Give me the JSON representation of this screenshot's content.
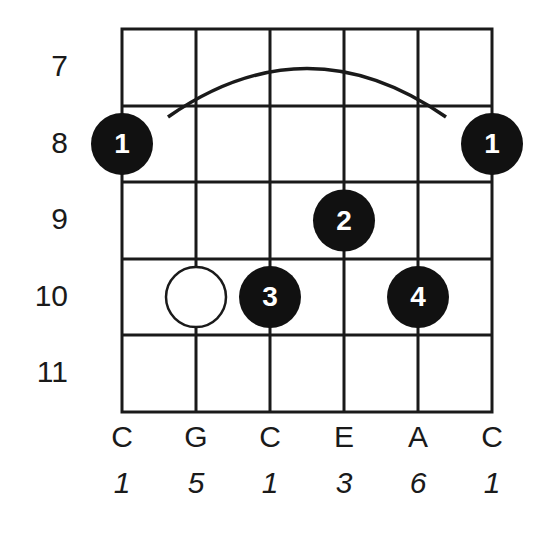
{
  "chord_diagram": {
    "frets": [
      "7",
      "8",
      "9",
      "10",
      "11"
    ],
    "strings": {
      "notes": [
        "C",
        "G",
        "C",
        "E",
        "A",
        "C"
      ],
      "intervals": [
        "1",
        "5",
        "1",
        "3",
        "6",
        "1"
      ]
    },
    "barre": {
      "fret": "8",
      "from_string": 0,
      "to_string": 5,
      "finger": "1"
    },
    "fingerings": [
      {
        "string": 0,
        "fret_index": 1,
        "finger": "1",
        "type": "filled"
      },
      {
        "string": 5,
        "fret_index": 1,
        "finger": "1",
        "type": "filled"
      },
      {
        "string": 3,
        "fret_index": 2,
        "finger": "2",
        "type": "filled"
      },
      {
        "string": 1,
        "fret_index": 3,
        "finger": "",
        "type": "open-circle"
      },
      {
        "string": 2,
        "fret_index": 3,
        "finger": "3",
        "type": "filled"
      },
      {
        "string": 4,
        "fret_index": 3,
        "finger": "4",
        "type": "filled"
      }
    ],
    "colors": {
      "line": "#1a1a1a",
      "dot": "#111111",
      "dot_text": "#ffffff",
      "background": "#ffffff"
    }
  }
}
